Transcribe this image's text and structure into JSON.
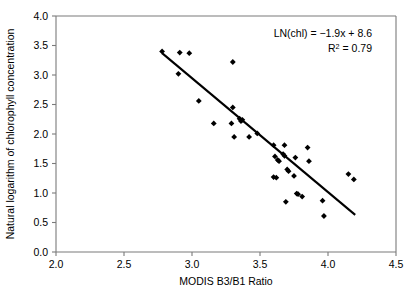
{
  "chart_data": {
    "type": "scatter",
    "title": "",
    "xlabel": "MODIS B3/B1 Ratio",
    "ylabel": "Natural logarithm of chlorophyll concentration",
    "xlim": [
      2.0,
      4.5
    ],
    "ylim": [
      0.0,
      4.0
    ],
    "xticks": [
      "2.0",
      "2.5",
      "3.0",
      "3.5",
      "4.0",
      "4.5"
    ],
    "xtick_values": [
      2.0,
      2.5,
      3.0,
      3.5,
      4.0,
      4.5
    ],
    "yticks": [
      "0.0",
      "0.5",
      "1.0",
      "1.5",
      "2.0",
      "2.5",
      "3.0",
      "3.5",
      "4.0"
    ],
    "ytick_values": [
      0.0,
      0.5,
      1.0,
      1.5,
      2.0,
      2.5,
      3.0,
      3.5,
      4.0
    ],
    "grid": false,
    "legend": false,
    "marker_style": "filled-diamond",
    "marker_color": "#000000",
    "series": [
      {
        "name": "samples",
        "points": [
          [
            2.78,
            3.4
          ],
          [
            2.91,
            3.38
          ],
          [
            2.98,
            3.37
          ],
          [
            2.9,
            3.02
          ],
          [
            3.05,
            2.56
          ],
          [
            3.3,
            3.22
          ],
          [
            3.16,
            2.18
          ],
          [
            3.3,
            2.45
          ],
          [
            3.29,
            2.18
          ],
          [
            3.35,
            2.26
          ],
          [
            3.36,
            2.22
          ],
          [
            3.37,
            2.24
          ],
          [
            3.31,
            1.95
          ],
          [
            3.42,
            1.95
          ],
          [
            3.48,
            2.01
          ],
          [
            3.6,
            1.81
          ],
          [
            3.68,
            1.81
          ],
          [
            3.61,
            1.62
          ],
          [
            3.63,
            1.56
          ],
          [
            3.64,
            1.54
          ],
          [
            3.67,
            1.66
          ],
          [
            3.68,
            1.63
          ],
          [
            3.76,
            1.6
          ],
          [
            3.85,
            1.77
          ],
          [
            3.86,
            1.54
          ],
          [
            3.6,
            1.27
          ],
          [
            3.62,
            1.26
          ],
          [
            3.7,
            1.4
          ],
          [
            3.71,
            1.37
          ],
          [
            3.75,
            1.29
          ],
          [
            3.69,
            0.85
          ],
          [
            3.77,
            0.99
          ],
          [
            3.78,
            0.98
          ],
          [
            3.81,
            0.94
          ],
          [
            3.96,
            0.87
          ],
          [
            3.97,
            0.61
          ],
          [
            4.15,
            1.32
          ],
          [
            4.19,
            1.23
          ]
        ]
      }
    ],
    "fit_line": {
      "equation_label": "LN(chl) = −1.9x + 8.6",
      "r2_label": "R",
      "r2_sup": "2",
      "r2_value": " = 0.79",
      "slope": -1.9,
      "intercept": 8.6,
      "r_squared": 0.79,
      "x_start": 2.78,
      "y_start": 3.37,
      "x_end": 4.2,
      "y_end": 0.63
    }
  },
  "figure": {
    "background_color": "#ffffff",
    "axis_color": "#7a7a7a",
    "data_color": "#000000"
  }
}
